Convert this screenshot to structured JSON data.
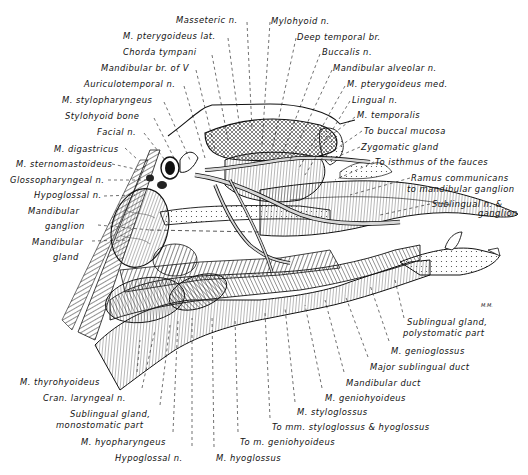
{
  "figure": {
    "type": "anatomical illustration",
    "signature": "M.M."
  },
  "labels": {
    "top": [
      {
        "text": "Masseteric n.",
        "x": 176,
        "y": 15
      },
      {
        "text": "M. pterygoideus lat.",
        "x": 123,
        "y": 31
      },
      {
        "text": "Chorda tympani",
        "x": 123,
        "y": 47
      },
      {
        "text": "Mandibular br. of V",
        "x": 101,
        "y": 63
      },
      {
        "text": "Auriculotemporal n.",
        "x": 84,
        "y": 79
      },
      {
        "text": "M. stylopharyngeus",
        "x": 62,
        "y": 95
      },
      {
        "text": "Stylohyoid bone",
        "x": 65,
        "y": 111
      },
      {
        "text": "Facial n.",
        "x": 97,
        "y": 127
      },
      {
        "text": "Mylohyoid n.",
        "x": 271,
        "y": 16
      },
      {
        "text": "Deep temporal br.",
        "x": 297,
        "y": 32
      },
      {
        "text": "Buccalis n.",
        "x": 322,
        "y": 47
      },
      {
        "text": "Mandibular alveolar n.",
        "x": 333,
        "y": 63
      },
      {
        "text": "M. pterygoideus med.",
        "x": 347,
        "y": 79
      },
      {
        "text": "Lingual n.",
        "x": 352,
        "y": 95
      },
      {
        "text": "M. temporalis",
        "x": 357,
        "y": 110
      },
      {
        "text": "To buccal mucosa",
        "x": 364,
        "y": 126
      }
    ],
    "right": [
      {
        "text": "Zygomatic gland",
        "x": 361,
        "y": 142
      },
      {
        "text": "To isthmus of the fauces",
        "x": 375,
        "y": 157
      },
      {
        "text": "Ramus communicans",
        "x": 411,
        "y": 173
      },
      {
        "text": "to mandibular ganglion",
        "x": 407,
        "y": 184
      },
      {
        "text": "Sublingual n. & ",
        "x": 432,
        "y": 199
      },
      {
        "text": "ganglion",
        "x": 478,
        "y": 208
      },
      {
        "text": "Sublingual gland,",
        "x": 407,
        "y": 317
      },
      {
        "text": "polystomatic part",
        "x": 403,
        "y": 328
      },
      {
        "text": "M. genioglossus",
        "x": 391,
        "y": 346
      },
      {
        "text": "Major sublingual duct",
        "x": 370,
        "y": 362
      },
      {
        "text": "Mandibular duct",
        "x": 346,
        "y": 378
      },
      {
        "text": "M. geniohyoideus",
        "x": 325,
        "y": 393
      },
      {
        "text": "M. styloglossus",
        "x": 297,
        "y": 407
      },
      {
        "text": "To mm. styloglossus & hyoglossus",
        "x": 272,
        "y": 422
      },
      {
        "text": "To m. geniohyoideus",
        "x": 240,
        "y": 437
      },
      {
        "text": "M. hyoglossus",
        "x": 216,
        "y": 453
      }
    ],
    "left": [
      {
        "text": "M. digastricus",
        "x": 54,
        "y": 144
      },
      {
        "text": "M. sternomastoideus",
        "x": 16,
        "y": 159
      },
      {
        "text": "Glossopharyngeal n.",
        "x": 10,
        "y": 175
      },
      {
        "text": "Hypoglossal n.",
        "x": 34,
        "y": 190
      },
      {
        "text": "Mandibular",
        "x": 28,
        "y": 206
      },
      {
        "text": "ganglion",
        "x": 45,
        "y": 221
      },
      {
        "text": "Mandibular",
        "x": 32,
        "y": 237
      },
      {
        "text": "gland",
        "x": 53,
        "y": 252
      }
    ],
    "bottom": [
      {
        "text": "M. thyrohyoideus",
        "x": 20,
        "y": 377
      },
      {
        "text": "Cran. laryngeal n.",
        "x": 43,
        "y": 393
      },
      {
        "text": "Sublingual gland,",
        "x": 70,
        "y": 409
      },
      {
        "text": "monostomatic part",
        "x": 56,
        "y": 420
      },
      {
        "text": "M. hyopharyngeus",
        "x": 81,
        "y": 437
      },
      {
        "text": "Hypoglossal n.",
        "x": 115,
        "y": 453
      }
    ]
  },
  "colors": {
    "ink": "#111111",
    "background": "#ffffff",
    "hatch": "#333333"
  }
}
